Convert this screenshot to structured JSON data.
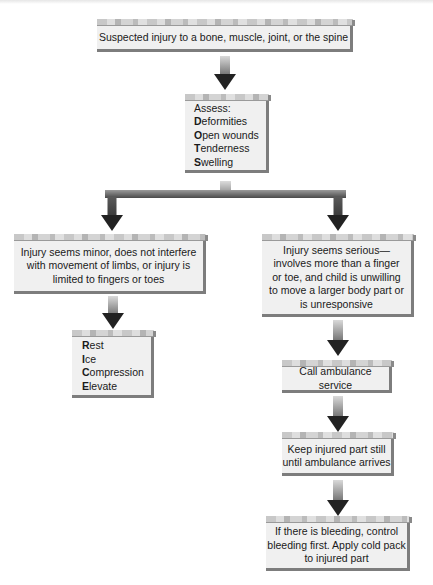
{
  "diagram": {
    "type": "flowchart",
    "colors": {
      "box_fill": "#f0f0f0",
      "box_shadow": "#7d7d7d",
      "arrow_head": "#222222",
      "arrow_shaft_top": "#d9d9d9",
      "arrow_shaft_bottom": "#6e6e6e"
    },
    "nodes": {
      "start": {
        "text": "Suspected injury to a bone, muscle, joint, or the spine"
      },
      "assess": {
        "heading": "Assess:",
        "items": [
          {
            "initial": "D",
            "rest": "eformities"
          },
          {
            "initial": "O",
            "rest": "pen wounds"
          },
          {
            "initial": "T",
            "rest": "enderness"
          },
          {
            "initial": "S",
            "rest": "welling"
          }
        ]
      },
      "minor": {
        "lines": [
          "Injury seems minor, does not interfere",
          "with movement of limbs, or injury is",
          "limited to fingers or toes"
        ]
      },
      "rice": {
        "items": [
          {
            "initial": "R",
            "rest": "est"
          },
          {
            "initial": "I",
            "rest": "ce"
          },
          {
            "initial": "C",
            "rest": "ompression"
          },
          {
            "initial": "E",
            "rest": "levate"
          }
        ]
      },
      "serious": {
        "lines": [
          "Injury seems serious—",
          "involves more than a finger",
          "or toe, and child is unwilling",
          "to move a larger body part or",
          "is unresponsive"
        ]
      },
      "ambulance": {
        "text": "Call ambulance service"
      },
      "keep_still": {
        "lines": [
          "Keep injured part still",
          "until ambulance arrives"
        ]
      },
      "bleeding": {
        "lines": [
          "If there is bleeding, control",
          "bleeding first. Apply cold pack",
          "to injured part"
        ]
      }
    },
    "edges": [
      {
        "from": "start",
        "to": "assess"
      },
      {
        "from": "assess",
        "to": "minor"
      },
      {
        "from": "assess",
        "to": "serious"
      },
      {
        "from": "minor",
        "to": "rice"
      },
      {
        "from": "serious",
        "to": "ambulance"
      },
      {
        "from": "ambulance",
        "to": "keep_still"
      },
      {
        "from": "keep_still",
        "to": "bleeding"
      }
    ]
  }
}
